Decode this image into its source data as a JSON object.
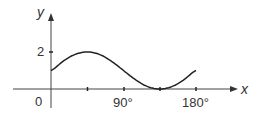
{
  "chart_data": {
    "type": "line",
    "title": "",
    "xlabel": "x",
    "ylabel": "y",
    "x_ticks": [
      "90°",
      "180°"
    ],
    "x_tick_positions_deg": [
      45,
      90,
      135,
      180
    ],
    "y_ticks": [
      "2"
    ],
    "origin_label": "0",
    "xlim": [
      0,
      180
    ],
    "ylim": [
      0,
      2
    ],
    "grid": false,
    "series": [
      {
        "name": "y = 1 + sin 2x",
        "x": [
          0,
          15,
          30,
          45,
          60,
          75,
          90,
          105,
          120,
          135,
          150,
          165,
          180
        ],
        "values": [
          1,
          1.5,
          1.87,
          2,
          1.87,
          1.5,
          1,
          0.5,
          0.13,
          0,
          0.13,
          0.5,
          1
        ]
      }
    ]
  },
  "labels": {
    "y_axis": "y",
    "x_axis": "x",
    "origin": "0",
    "y_tick_2": "2",
    "x_tick_90": "90°",
    "x_tick_180": "180°"
  }
}
